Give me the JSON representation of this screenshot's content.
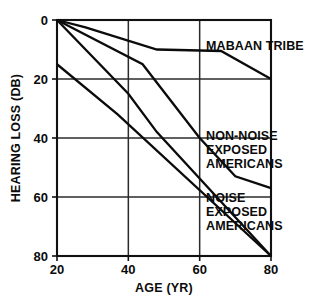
{
  "chart_data": {
    "type": "line",
    "title": "",
    "xlabel": "AGE (YR)",
    "ylabel": "HEARING LOSS (DB)",
    "xlim": [
      20,
      80
    ],
    "ylim": [
      0,
      80
    ],
    "y_inverted": true,
    "grid": true,
    "legend_position": "inline-annotations",
    "xticks": [
      20,
      40,
      60,
      80
    ],
    "xtick_labels": [
      "20",
      "40",
      "60",
      "80"
    ],
    "yticks": [
      0,
      20,
      40,
      60,
      80
    ],
    "ytick_labels": [
      "0",
      "20",
      "40",
      "60",
      "80"
    ],
    "series": [
      {
        "name": "MABAAN TRIBE",
        "label_lines": [
          "MABAAN TRIBE"
        ],
        "x": [
          20,
          28,
          48,
          66,
          80
        ],
        "values": [
          0,
          2.5,
          10,
          10.5,
          20
        ]
      },
      {
        "name": "NON-NOISE EXPOSED AMERICANS",
        "label_lines": [
          "NON-NOISE",
          "EXPOSED",
          "AMERICANS"
        ],
        "x": [
          20,
          44,
          60,
          70,
          80
        ],
        "values": [
          0,
          15,
          40,
          53,
          57
        ]
      },
      {
        "name": "NOISE EXPOSED AMERICANS",
        "label_lines": [
          "NOISE",
          "EXPOSED",
          "AMERICANS"
        ],
        "x": [
          20,
          40,
          48,
          80
        ],
        "values": [
          0,
          25,
          38,
          80
        ]
      },
      {
        "name": "NOISE EXPOSED AMERICANS (lower)",
        "label_lines": [],
        "x": [
          20,
          37,
          80
        ],
        "values": [
          15,
          32,
          80
        ]
      }
    ],
    "annotations": [
      {
        "id": "mabaan",
        "text_lines": [
          "MABAAN TRIBE"
        ],
        "x_px": 206,
        "y_px": 50
      },
      {
        "id": "non-noise",
        "text_lines": [
          "NON-NOISE",
          "EXPOSED",
          "AMERICANS"
        ],
        "x_px": 206,
        "y_px": 140
      },
      {
        "id": "noise",
        "text_lines": [
          "NOISE",
          "EXPOSED",
          "AMERICANS"
        ],
        "x_px": 206,
        "y_px": 202
      }
    ]
  },
  "axes": {
    "x_title": "AGE (YR)",
    "y_title": "HEARING LOSS (DB)"
  },
  "colors": {
    "line": "#0b0b0b",
    "grid": "#2b2b2b",
    "background": "#ffffff"
  }
}
